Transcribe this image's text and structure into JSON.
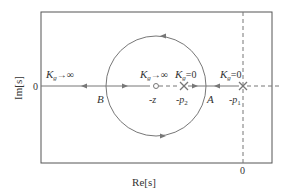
{
  "diagram": {
    "type": "root-locus",
    "axes": {
      "xlabel": "Re[s]",
      "ylabel": "Im[s]",
      "x_origin_label": "0",
      "y_origin_label": "0"
    },
    "points": {
      "p1": {
        "label": "-p",
        "sub": "1",
        "gain_label": "K",
        "gain_sub": "g",
        "gain_value": "=0",
        "marker": "cross"
      },
      "p2": {
        "label": "-p",
        "sub": "2",
        "gain_label": "K",
        "gain_sub": "g",
        "gain_value": "=0",
        "marker": "cross"
      },
      "z": {
        "label": "-z",
        "gain_label": "K",
        "gain_sub": "g",
        "gain_value": "→∞",
        "marker": "circle"
      },
      "A": {
        "label": "A"
      },
      "B": {
        "label": "B"
      }
    },
    "left_annotation": {
      "gain_label": "K",
      "gain_sub": "g",
      "gain_value": "→∞"
    },
    "colors": {
      "line": "#777777",
      "frame": "#555555",
      "text": "#333333"
    }
  }
}
